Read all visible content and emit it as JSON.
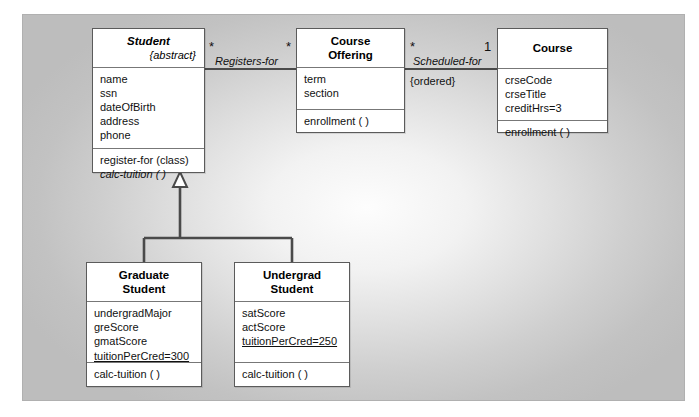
{
  "diagram": {
    "type": "uml-class-diagram"
  },
  "classes": [
    {
      "id": "student",
      "name": "Student",
      "name_style": "bold-italic",
      "stereotype": "{abstract}",
      "attributes": [
        "name",
        "ssn",
        "dateOfBirth",
        "address",
        "phone"
      ],
      "operations": [
        {
          "text": "register-for (class)",
          "italic": false
        },
        {
          "text": "calc-tuition ( )",
          "italic": true
        }
      ]
    },
    {
      "id": "course-offering",
      "name": "Course Offering",
      "name_line1": "Course",
      "name_line2": "Offering",
      "name_style": "bold",
      "stereotype": "",
      "attributes": [
        "term",
        "section"
      ],
      "operations": [
        {
          "text": "enrollment ( )",
          "italic": false
        }
      ]
    },
    {
      "id": "course",
      "name": "Course",
      "name_line1": "Course",
      "name_line2": "",
      "name_style": "bold",
      "stereotype": "",
      "attributes": [
        "crseCode",
        "crseTitle",
        "creditHrs=3"
      ],
      "operations": [
        {
          "text": "enrollment ( )",
          "italic": false
        }
      ]
    },
    {
      "id": "graduate-student",
      "name": "Graduate Student",
      "name_line1": "Graduate",
      "name_line2": "Student",
      "name_style": "bold",
      "stereotype": "",
      "attributes": [
        "undergradMajor",
        "greScore",
        "gmatScore",
        "tuitionPerCred=300"
      ],
      "attributes_underlined": [
        "tuitionPerCred=300"
      ],
      "operations": [
        {
          "text": "calc-tuition ( )",
          "italic": false
        }
      ]
    },
    {
      "id": "undergrad-student",
      "name": "Undergrad Student",
      "name_line1": "Undergrad",
      "name_line2": "Student",
      "name_style": "bold",
      "stereotype": "",
      "attributes": [
        "satScore",
        "actScore",
        "tuitionPerCred=250"
      ],
      "attributes_underlined": [
        "tuitionPerCred=250"
      ],
      "operations": [
        {
          "text": "calc-tuition ( )",
          "italic": false
        }
      ]
    }
  ],
  "associations": [
    {
      "id": "registers-for",
      "label": "Registers-for",
      "source": "Student",
      "target": "Course Offering",
      "source_multiplicity": "*",
      "target_multiplicity": "*",
      "constraint": ""
    },
    {
      "id": "scheduled-for",
      "label": "Scheduled-for",
      "source": "Course Offering",
      "target": "Course",
      "source_multiplicity": "*",
      "target_multiplicity": "1",
      "constraint": "{ordered}"
    }
  ],
  "generalizations": [
    {
      "id": "grad-to-student",
      "subclass": "Graduate Student",
      "superclass": "Student"
    },
    {
      "id": "undergrad-to-student",
      "subclass": "Undergrad Student",
      "superclass": "Student"
    }
  ],
  "colors": {
    "class_fill": "#ffffff",
    "class_border": "#5b5b5b",
    "line": "#4a4a4a",
    "canvas_edge": "#bdbdbd",
    "canvas_center": "#fdfdfd",
    "text": "#111111"
  }
}
